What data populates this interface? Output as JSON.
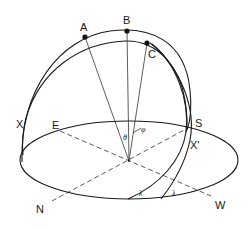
{
  "figure": {
    "colors": {
      "line": "#1a1a1a",
      "background": "#ffffff"
    }
  },
  "points": {
    "A": "A",
    "B": "B",
    "C": "C"
  },
  "labels": {
    "X": "X",
    "X_prime": "X'",
    "E": "E",
    "S": "S",
    "N": "N",
    "W": "W",
    "theta": "θ",
    "phi": "φ",
    "lambda_1": "λ",
    "lambda_2": "λ"
  }
}
